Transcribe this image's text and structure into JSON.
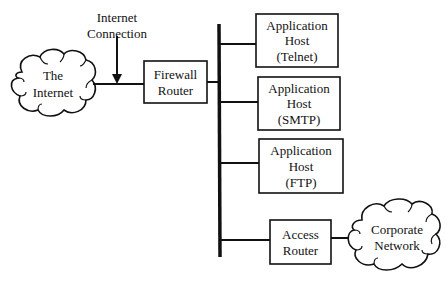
{
  "diagram": {
    "type": "network-topology",
    "internet_cloud": {
      "line1": "The",
      "line2": "Internet"
    },
    "connection_label": {
      "line1": "Internet",
      "line2": "Connection"
    },
    "firewall_router": {
      "line1": "Firewall",
      "line2": "Router"
    },
    "hosts": [
      {
        "line1": "Application",
        "line2": "Host",
        "line3": "(Telnet)"
      },
      {
        "line1": "Application",
        "line2": "Host",
        "line3": "(SMTP)"
      },
      {
        "line1": "Application",
        "line2": "Host",
        "line3": "(FTP)"
      }
    ],
    "access_router": {
      "line1": "Access",
      "line2": "Router"
    },
    "corporate_cloud": {
      "line1": "Corporate",
      "line2": "Network"
    },
    "colors": {
      "stroke": "#111111",
      "background": "#ffffff"
    }
  }
}
